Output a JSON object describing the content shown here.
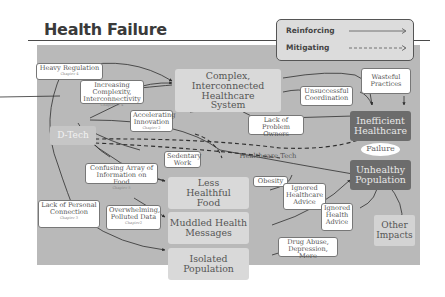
{
  "title": "Health Failure",
  "legend": {
    "reinforcing": "Reinforcing",
    "mitigating": "Mitigating"
  },
  "nodes": {
    "heavy_regulation": {
      "label": "Heavy Regulation",
      "chapter": "Chapter 4"
    },
    "increasing_complexity": {
      "label": "Increasing Complexity, Interconnectivity",
      "chapter": "Chapter 2, 4"
    },
    "accelerating_innovation": {
      "label": "Accelerating Innovation",
      "chapter": "Chapter 2"
    },
    "d_tech": {
      "label": "D-Tech"
    },
    "complex_system": {
      "label": "Complex, Interconnected Healthcare System"
    },
    "unsuccessful_coordination": {
      "label": "Unsuccessful Coordination"
    },
    "wasteful_practices": {
      "label": "Wasteful Practices"
    },
    "lack_problem_owners": {
      "label": "Lack of Problem Owners"
    },
    "inefficient_healthcare": {
      "label": "Inefficient Healthcare"
    },
    "failure": {
      "label": "Failure"
    },
    "unhealthy_population": {
      "label": "Unhealthy Population"
    },
    "sedentary_work": {
      "label": "Sedentary Work"
    },
    "healthcare_tech": {
      "label": "Healthcare Tech"
    },
    "confusing_array": {
      "label": "Confusing Array of Information on Food",
      "chapter": "Chapter 5"
    },
    "less_healthful_food": {
      "label": "Less Healthful Food"
    },
    "obesity": {
      "label": "Obesity"
    },
    "ignored_healthcare_advice": {
      "label": "Ignored Healthcare Advice"
    },
    "ignored_health_advice": {
      "label": "Ignored Health Advice"
    },
    "lack_personal_connection": {
      "label": "Lack of Personal Connection",
      "chapter": "Chapter 3"
    },
    "overwhelming_data": {
      "label": "Overwhelming, Polluted Data",
      "chapter": "Chapter2"
    },
    "muddled_messages": {
      "label": "Muddled Health Messages"
    },
    "isolated_population": {
      "label": "Isolated Population"
    },
    "drug_abuse": {
      "label": "Drug Abuse, Depression, More"
    },
    "other_impacts": {
      "label": "Other Impacts"
    }
  },
  "colors": {
    "canvas": "#b9b9b9",
    "outcome_dark": "#6c6c6c",
    "intermediate": "#d9d9d9",
    "line": "#2e2e2e"
  }
}
